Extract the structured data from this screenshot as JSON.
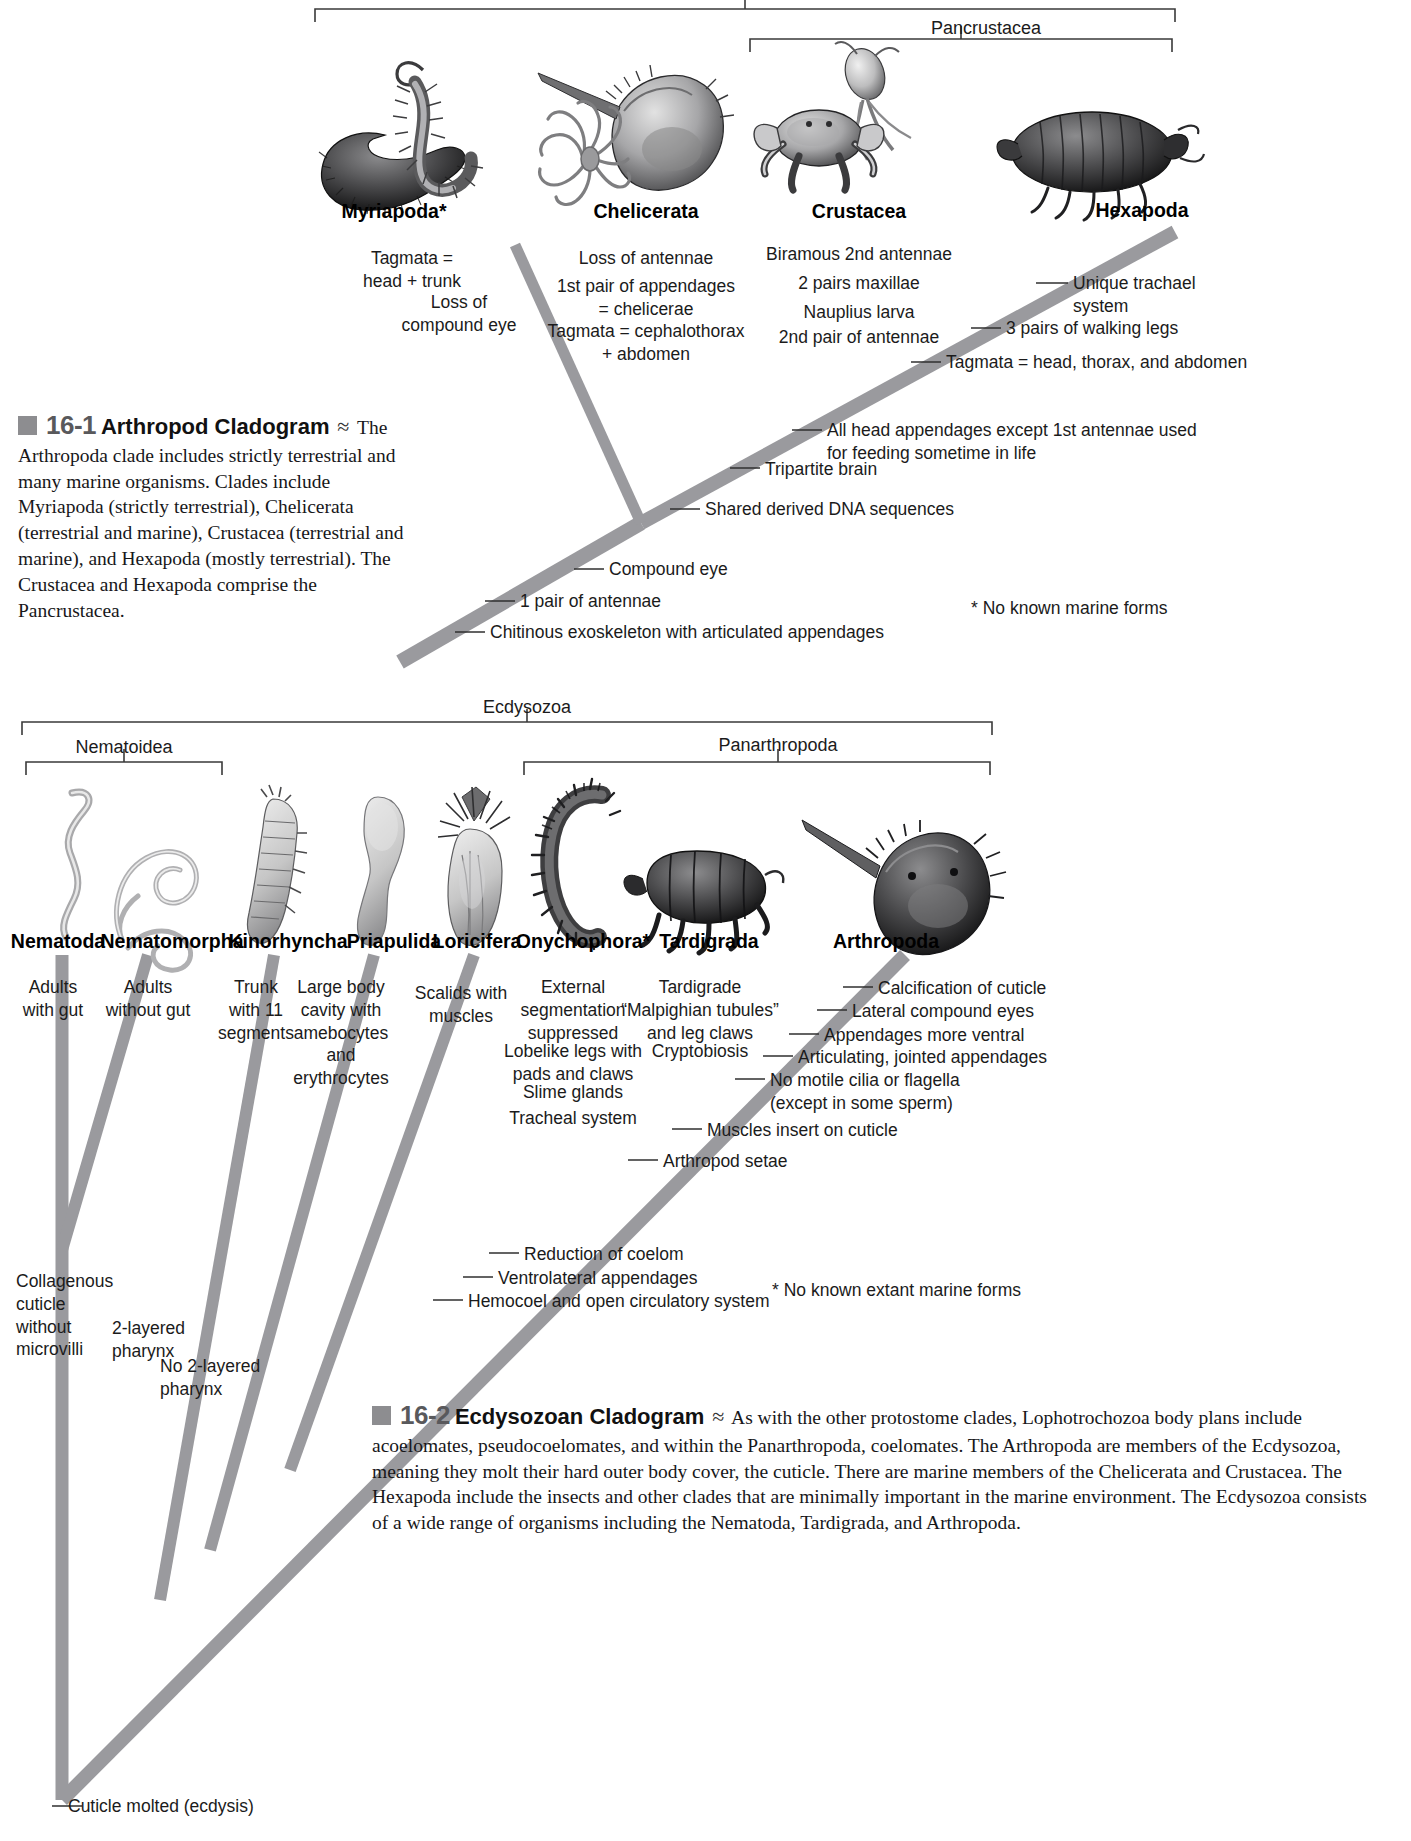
{
  "figure1": {
    "clade_labels": [
      {
        "name": "Pancrustacea"
      }
    ],
    "taxa": [
      {
        "name": "Myriapoda*",
        "icon": "millipede-centipede-illustration"
      },
      {
        "name": "Chelicerata",
        "icon": "horseshoe-crab-spider-illustration"
      },
      {
        "name": "Crustacea",
        "icon": "crab-copepod-illustration"
      },
      {
        "name": "Hexapoda",
        "icon": "insect-illustration"
      }
    ],
    "synapomorphies": {
      "myriapoda": "Tagmata =\nhead + trunk",
      "myriapoda2": "Loss of\ncompound eye",
      "chelicerata1": "Loss of antennae",
      "chelicerata2": "1st pair of appendages\n= chelicerae",
      "chelicerata3": "Tagmata = cephalothorax\n+ abdomen",
      "crustacea1": "Biramous 2nd antennae",
      "crustacea2": "2 pairs maxillae",
      "crustacea3": "Nauplius larva",
      "crustacea4": "2nd pair of antennae",
      "hexapoda1": "Unique trachael\nsystem",
      "hexapoda2": "3 pairs of walking legs",
      "hexapoda3": "Tagmata = head, thorax, and abdomen",
      "node1": "All head appendages except 1st antennae used\nfor feeding sometime in life",
      "node2": "Tripartite brain",
      "node3": "Shared derived DNA sequences",
      "node4": "Compound eye",
      "node5": "1 pair of antennae",
      "node6": "Chitinous exoskeleton with articulated appendages"
    },
    "footnote": "* No known marine forms",
    "caption": {
      "number": "16-1",
      "title": "Arthropod Cladogram",
      "body": "The Arthropoda clade includes strictly terrestrial and many marine organisms. Clades include Myriapoda (strictly terrestrial), Chelicerata (terrestrial and marine), Crustacea (terrestrial and marine), and Hexapoda (mostly terrestrial). The Crustacea and Hexapoda comprise the Pancrustacea."
    }
  },
  "figure2": {
    "clade_labels": [
      {
        "name": "Ecdysozoa"
      },
      {
        "name": "Nematoidea"
      },
      {
        "name": "Panarthropoda"
      }
    ],
    "taxa": [
      {
        "name": "Nematoda",
        "icon": "roundworm-illustration"
      },
      {
        "name": "Nematomorpha",
        "icon": "horsehair-worm-illustration"
      },
      {
        "name": "Kinorhyncha",
        "icon": "kinorhynch-illustration"
      },
      {
        "name": "Priapulida",
        "icon": "priapulid-worm-illustration"
      },
      {
        "name": "Loricifera",
        "icon": "loriciferan-illustration"
      },
      {
        "name": "Onychophora*",
        "icon": "velvet-worm-illustration"
      },
      {
        "name": "Tardigrada",
        "icon": "water-bear-illustration"
      },
      {
        "name": "Arthropoda",
        "icon": "horseshoe-crab-illustration"
      }
    ],
    "synapomorphies": {
      "nematoda": "Adults\nwith gut",
      "nematomorpha": "Adults\nwithout gut",
      "kinorhyncha": "Trunk\nwith 11\nsegments",
      "priapulida": "Large body\ncavity with\namebocytes\nand\nerythrocytes",
      "loricifera": "Scalids with\nmuscles",
      "onychophora1": "External\nsegmentation\nsuppressed",
      "onychophora2": "Lobelike legs with\npads and claws",
      "onychophora3": "Slime glands",
      "onychophora4": "Tracheal system",
      "tardigrada1": "Tardigrade\n“Malpighian tubules”\nand leg claws",
      "tardigrada2": "Cryptobiosis",
      "arthropoda1": "Calcification of cuticle",
      "arthropoda2": "Lateral compound eyes",
      "arthropoda3": "Appendages more ventral",
      "arthropoda4": "Articulating, jointed appendages",
      "arthropoda5": "No motile cilia or flagella\n(except in some sperm)",
      "node1": "Muscles insert on cuticle",
      "node2": "Arthropod setae",
      "node3": "Reduction of coelom",
      "node4": "Ventrolateral appendages",
      "node5": "Hemocoel and open circulatory system",
      "node6": "Collagenous\ncuticle\nwithout\nmicrovilli",
      "node7": "2-layered\npharynx",
      "node8": "No 2-layered\npharynx",
      "node9": "Cuticle molted (ecdysis)"
    },
    "footnote": "* No known extant marine forms",
    "caption": {
      "number": "16-2",
      "title": "Ecdysozoan Cladogram",
      "body": "As with the other protostome clades, Lophotrochozoa body plans include acoelomates, pseudocoelomates, and within the Panarthropoda, coelomates. The Arthropoda are members of the Ecdysozoa, meaning they molt their hard outer body cover, the cuticle. There are marine members of the Chelicerata and Crustacea. The Hexapoda include the insects and other clades that are minimally important in the marine environment. The Ecdysozoa consists of a wide range of organisms including the Nematoda, Tardigrada, and Arthropoda."
    }
  },
  "colors": {
    "branch": "#9a9a9e",
    "branch_dark": "#8a8a8e",
    "leader": "#3a3a3a",
    "bracket": "#3a3a3a",
    "text": "#1b1b1b"
  }
}
